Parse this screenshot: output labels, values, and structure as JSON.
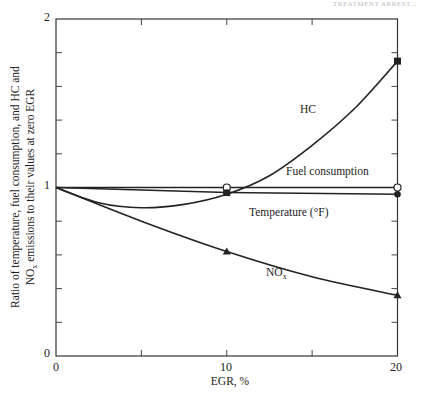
{
  "header": {
    "running_title": "TREATMENT ARREST..."
  },
  "chart_data": {
    "type": "line",
    "title": "",
    "xlabel": "EGR, %",
    "ylabel_line1": "Ratio of temperature, fuel consumption, and HC and",
    "ylabel_line2_prefix": "NO",
    "ylabel_line2_sub": "x",
    "ylabel_line2_suffix": " emissions to their values at zero EGR",
    "xlim": [
      0,
      20
    ],
    "ylim": [
      0,
      2
    ],
    "x_tick_labels": [
      "0",
      "10",
      "20"
    ],
    "y_tick_labels": [
      "0",
      "1",
      "2"
    ],
    "x_minor_ticks": [
      5,
      15
    ],
    "y_minor_ticks": [
      0.2,
      0.4,
      0.6,
      0.8,
      1.2,
      1.4,
      1.6,
      1.8
    ],
    "grid": false,
    "legend": "inline labels",
    "series": [
      {
        "name": "HC",
        "marker": "filled-square",
        "x": [
          0,
          2.5,
          5,
          7.5,
          10,
          12.5,
          15,
          17.5,
          20
        ],
        "values": [
          1.0,
          0.91,
          0.88,
          0.9,
          0.96,
          1.07,
          1.25,
          1.47,
          1.75
        ],
        "marker_points": [
          [
            10,
            0.97
          ],
          [
            20,
            1.75
          ]
        ]
      },
      {
        "name": "Fuel consumption",
        "marker": "open-circle",
        "x": [
          0,
          10,
          20
        ],
        "values": [
          1.0,
          1.0,
          1.0
        ],
        "marker_points": [
          [
            10,
            1.0
          ],
          [
            20,
            1.0
          ]
        ]
      },
      {
        "name": "Temperature (°F)",
        "marker": "filled-circle",
        "x": [
          0,
          10,
          20
        ],
        "values": [
          1.0,
          0.97,
          0.96
        ],
        "marker_points": [
          [
            10,
            0.97
          ],
          [
            20,
            0.96
          ]
        ]
      },
      {
        "name": "NOx",
        "label_prefix": "NO",
        "label_sub": "x",
        "marker": "filled-triangle",
        "x": [
          0,
          5,
          10,
          15,
          20
        ],
        "values": [
          1.0,
          0.8,
          0.62,
          0.47,
          0.36
        ],
        "marker_points": [
          [
            10,
            0.62
          ],
          [
            20,
            0.36
          ]
        ]
      }
    ]
  }
}
